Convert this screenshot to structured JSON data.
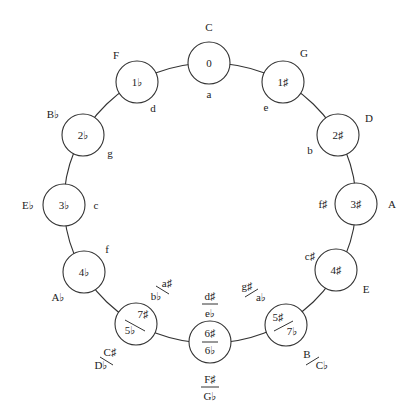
{
  "diagram": {
    "colors": {
      "stroke": "#333333",
      "text": "#222222",
      "background": "#ffffff"
    },
    "geometry": {
      "cx": 210,
      "cy": 203,
      "rx": 146,
      "ry": 140,
      "node_r": 21
    },
    "nodes": [
      {
        "angle": 0,
        "signature": "0",
        "major": "C",
        "minor": "a"
      },
      {
        "angle": 30,
        "signature": "1♯",
        "major": "G",
        "minor": "e"
      },
      {
        "angle": 60,
        "signature": "2♯",
        "major": "D",
        "minor": "b"
      },
      {
        "angle": 90,
        "signature": "3♯",
        "major": "A",
        "minor": "f♯"
      },
      {
        "angle": 120,
        "signature": "4♯",
        "major": "E",
        "minor": "c♯"
      },
      {
        "angle": 150,
        "signature_top": "5♯",
        "signature_bottom": "7♭",
        "major_top": "B",
        "major_bottom": "C♭",
        "minor_top": "g♯",
        "minor_bottom": "a♭"
      },
      {
        "angle": 180,
        "signature_top": "6♯",
        "signature_bottom": "6♭",
        "major_top": "F♯",
        "major_bottom": "G♭",
        "minor_top": "d♯",
        "minor_bottom": "e♭"
      },
      {
        "angle": 210,
        "signature_top": "7♯",
        "signature_bottom": "5♭",
        "major_top": "C♯",
        "major_bottom": "D♭",
        "minor_top": "a♯",
        "minor_bottom": "b♭"
      },
      {
        "angle": 240,
        "signature": "4♭",
        "major": "A♭",
        "minor": "f"
      },
      {
        "angle": 270,
        "signature": "3♭",
        "major": "E♭",
        "minor": "c"
      },
      {
        "angle": 300,
        "signature": "2♭",
        "major": "B♭",
        "minor": "g"
      },
      {
        "angle": 330,
        "signature": "1♭",
        "major": "F",
        "minor": "d"
      }
    ]
  }
}
